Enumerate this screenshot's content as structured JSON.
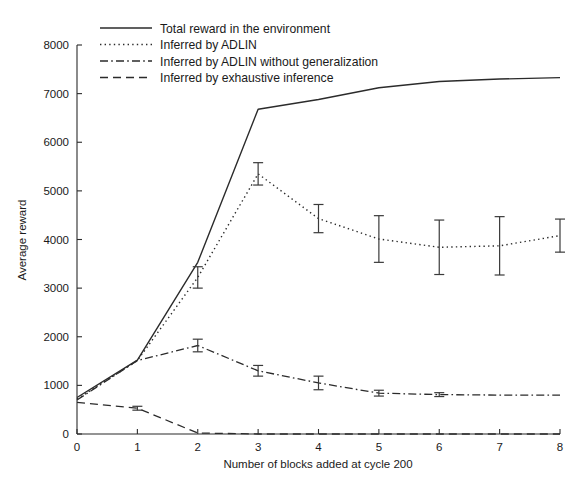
{
  "chart_data": {
    "type": "line",
    "title": "",
    "xlabel": "Number of blocks added at cycle 200",
    "ylabel": "Average reward",
    "xlim": [
      0,
      8
    ],
    "ylim": [
      0,
      8000
    ],
    "xticks": [
      0,
      1,
      2,
      3,
      4,
      5,
      6,
      7,
      8
    ],
    "xtick_labels": [
      "0",
      "1",
      "2",
      "3",
      "4",
      "5",
      "6",
      "7",
      "8"
    ],
    "yticks": [
      0,
      1000,
      2000,
      3000,
      4000,
      5000,
      6000,
      7000,
      8000
    ],
    "ytick_labels": [
      "0",
      "1000",
      "2000",
      "3000",
      "4000",
      "5000",
      "6000",
      "7000",
      "8000"
    ],
    "grid": false,
    "legend_position": "top-left",
    "x": [
      0,
      1,
      2,
      3,
      4,
      5,
      6,
      7,
      8
    ],
    "series": [
      {
        "name": "Total reward in the environment",
        "style": "solid",
        "color": "#2b2b2b",
        "values": [
          750,
          1520,
          3530,
          6680,
          6880,
          7120,
          7250,
          7300,
          7330
        ],
        "errors": [
          0,
          0,
          0,
          0,
          0,
          0,
          0,
          0,
          0
        ]
      },
      {
        "name": "Inferred by ADLIN",
        "style": "dotted",
        "color": "#2b2b2b",
        "values": [
          720,
          1510,
          3220,
          5350,
          4430,
          4010,
          3840,
          3870,
          4080
        ],
        "errors": [
          0,
          0,
          220,
          230,
          290,
          480,
          560,
          600,
          340
        ]
      },
      {
        "name": "Inferred by ADLIN without generalization",
        "style": "dashdot",
        "color": "#2b2b2b",
        "values": [
          700,
          1510,
          1820,
          1300,
          1050,
          840,
          810,
          800,
          800
        ],
        "errors": [
          0,
          0,
          130,
          110,
          140,
          60,
          40,
          0,
          0
        ]
      },
      {
        "name": "Inferred by exhaustive inference",
        "style": "dashed",
        "color": "#2b2b2b",
        "values": [
          650,
          530,
          20,
          0,
          0,
          0,
          0,
          0,
          0
        ],
        "errors": [
          0,
          40,
          0,
          0,
          0,
          0,
          0,
          0,
          0
        ]
      }
    ]
  },
  "legend": {
    "items": [
      {
        "label": "Total reward in the environment",
        "style": "solid"
      },
      {
        "label": "Inferred by ADLIN",
        "style": "dotted"
      },
      {
        "label": "Inferred by ADLIN without generalization",
        "style": "dashdot"
      },
      {
        "label": "Inferred by exhaustive inference",
        "style": "dashed"
      }
    ]
  }
}
